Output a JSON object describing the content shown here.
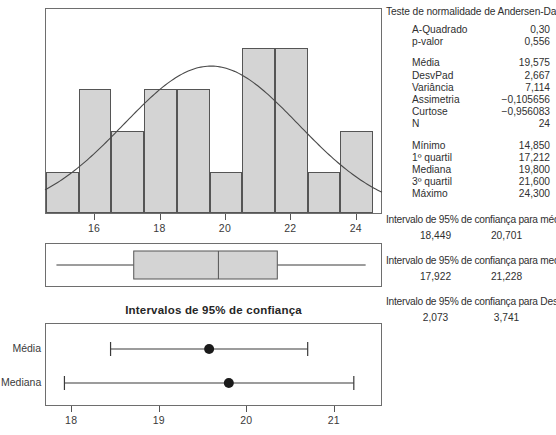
{
  "chart_data": [
    {
      "type": "bar",
      "name": "histogram",
      "title": "",
      "xlabel": "",
      "ylabel": "",
      "xlim": [
        14.5,
        24.8
      ],
      "ylim": [
        0,
        5
      ],
      "grid": false,
      "tick_labels": [
        "16",
        "18",
        "20",
        "22",
        "24"
      ],
      "ticks": [
        16,
        18,
        20,
        22,
        24
      ],
      "bin_edges": [
        14.5,
        15.5,
        16.5,
        17.5,
        18.5,
        19.5,
        20.5,
        21.5,
        22.5,
        23.5,
        24.5
      ],
      "categories": [
        "14.5-15.5",
        "15.5-16.5",
        "16.5-17.5",
        "17.5-18.5",
        "18.5-19.5",
        "19.5-20.5",
        "20.5-21.5",
        "21.5-22.5",
        "22.5-23.5",
        "23.5-24.5"
      ],
      "values": [
        1,
        3,
        2,
        3,
        3,
        1,
        4,
        4,
        1,
        2
      ],
      "overlay": {
        "type": "line",
        "name": "curva normal",
        "mean": 19.575,
        "stdev": 2.667
      }
    },
    {
      "type": "boxplot",
      "name": "boxplot",
      "min": 14.85,
      "q1": 17.212,
      "median": 19.8,
      "q3": 21.6,
      "max": 24.3,
      "xlim": [
        14.5,
        24.8
      ]
    },
    {
      "type": "scatter",
      "name": "intervalos-confianca",
      "title": "Intervalos de 95% de confiança",
      "xlim": [
        17.7,
        21.55
      ],
      "ticks": [
        18,
        19,
        20,
        21
      ],
      "tick_labels": [
        "18",
        "19",
        "20",
        "21"
      ],
      "rows": [
        {
          "label": "Média",
          "point": 19.575,
          "low": 18.449,
          "high": 20.701
        },
        {
          "label": "Mediana",
          "point": 19.8,
          "low": 17.922,
          "high": 21.228
        }
      ]
    }
  ],
  "histogram_axis": {
    "labels": [
      "16",
      "18",
      "20",
      "22",
      "24"
    ]
  },
  "ci_chart": {
    "title": "Intervalos de 95% de confiança",
    "row_labels": [
      "Média",
      "Mediana"
    ],
    "axis_labels": [
      "18",
      "19",
      "20",
      "21"
    ]
  },
  "stats": {
    "heading": "Teste de normalidade de Andersen-Darling",
    "group1": [
      {
        "key": "A-Quadrado",
        "value": "0,30"
      },
      {
        "key": "p-valor",
        "value": "0,556"
      }
    ],
    "group2": [
      {
        "key": "Média",
        "value": "19,575"
      },
      {
        "key": "DesvPad",
        "value": "2,667"
      },
      {
        "key": "Variância",
        "value": "7,114"
      },
      {
        "key": "Assimetria",
        "value": "−0,105656"
      },
      {
        "key": "Curtose",
        "value": "−0,956083"
      },
      {
        "key": "N",
        "value": "24"
      }
    ],
    "group3": [
      {
        "key": "Mínimo",
        "value": "14,850"
      },
      {
        "key": "1º quartil",
        "value": "17,212"
      },
      {
        "key": "Mediana",
        "value": "19,800"
      },
      {
        "key": "3º quartil",
        "value": "21,600"
      },
      {
        "key": "Máximo",
        "value": "24,300"
      }
    ],
    "ci_mean": {
      "heading": "Intervalo de 95% de confiança para média",
      "low": "18,449",
      "high": "20,701"
    },
    "ci_median": {
      "heading": "Intervalo de 95% de confiança para mediana",
      "low": "17,922",
      "high": "21,228"
    },
    "ci_stdev": {
      "heading": "Intervalo de 95% de confiança para DesvPad",
      "low": "2,073",
      "high": "3,741"
    }
  },
  "colors": {
    "bar_fill": "#d4d4d4",
    "bar_stroke": "#555555",
    "frame": "#6e6e6e",
    "curve": "#4a4a4a",
    "text": "#2f2f2f",
    "marker": "#1a1a1a"
  }
}
